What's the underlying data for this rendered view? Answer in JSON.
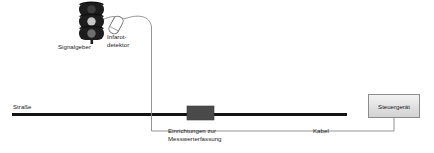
{
  "diagram": {
    "title_present": false,
    "background_color": "#ffffff",
    "labels": {
      "road": "Straße",
      "signal_head": "Signalgeber",
      "detector_line1": "Infarot-",
      "detector_line2": "detektor",
      "measurement_line1": "Einrichtungen zur",
      "measurement_line2": "Messwerterfassung",
      "cable": "Kabel",
      "control_unit": "Steuergerät"
    },
    "colors": {
      "line": "#0d0d0d",
      "road": "#141414",
      "thin_line": "#7a7a7a",
      "loop_block": "#4a4a4a",
      "box_border": "#8c8c8c",
      "box_fill_top": "#f2f2f2",
      "box_fill_bottom": "#d2d2d2",
      "lamp_housing": "#1f1f1f",
      "lamp_red": "#3b3b3b",
      "lamp_yellow": "#c9c9c9",
      "lamp_green": "#6e6e6e",
      "text": "#1a1a1a"
    },
    "elements": {
      "traffic_light": {
        "x": 78,
        "y": 2,
        "width": 28,
        "height": 40,
        "lamp_count": 3
      },
      "infrared_detector": {
        "x": 110,
        "y": 17,
        "width": 12,
        "height": 16,
        "rotation_deg": 28
      },
      "road_line": {
        "x1": 12,
        "y1": 114,
        "x2": 347,
        "y2": 114,
        "thickness": 3
      },
      "induction_loop_block": {
        "x": 187,
        "y": 106,
        "width": 27,
        "height": 14
      },
      "control_unit_box": {
        "x": 368,
        "y": 94,
        "width": 52,
        "height": 24
      },
      "detector_cable": {
        "from": "infrared-detector",
        "to": "induction-loop-block"
      },
      "control_cable": {
        "from": "induction-loop-block",
        "to": "control-unit-box"
      }
    }
  }
}
